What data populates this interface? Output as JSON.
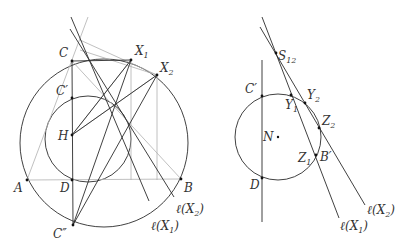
{
  "left_figure": {
    "labels": {
      "C": "C",
      "C_prime": "C′",
      "C_double_prime": "C″",
      "H": "H",
      "D": "D",
      "A": "A",
      "B": "B",
      "X1": "X",
      "X1_sub": "1",
      "X2": "X",
      "X2_sub": "2",
      "lX1": "ℓ(X",
      "lX1_sub": "1",
      "lX1_close": ")",
      "lX2": "ℓ(X",
      "lX2_sub": "2",
      "lX2_close": ")"
    },
    "points": {
      "C": [
        72,
        61
      ],
      "X1": [
        131,
        60
      ],
      "X2": [
        157,
        75
      ],
      "C_prime": [
        72,
        98
      ],
      "H": [
        72,
        135
      ],
      "D": [
        72,
        180
      ],
      "A": [
        27,
        180
      ],
      "B": [
        181,
        179
      ],
      "C_double_prime": [
        73,
        225
      ]
    },
    "circles": {
      "circumcircle": {
        "cx": 104,
        "cy": 143,
        "r": 84
      },
      "nine_point": {
        "cx": 88,
        "cy": 139,
        "r": 43
      }
    }
  },
  "right_figure": {
    "labels": {
      "S12": "S",
      "S12_sub": "12",
      "C_prime": "C′",
      "Y1": "Y",
      "Y1_sub": "1",
      "Y2": "Y",
      "Y2_sub": "2",
      "Z2": "Z",
      "Z2_sub": "2",
      "N": "N",
      "Z1": "Z",
      "Z1_sub": "1",
      "B_prime": "B′",
      "D": "D",
      "lX1": "ℓ(X",
      "lX1_sub": "1",
      "lX1_close": ")",
      "lX2": "ℓ(X",
      "lX2_sub": "2",
      "lX2_close": ")"
    },
    "points": {
      "S12": [
        276,
        53
      ],
      "C_prime": [
        262,
        96
      ],
      "Y1": [
        291,
        95
      ],
      "Y2": [
        305,
        103
      ],
      "Z2": [
        319,
        128
      ],
      "N": [
        278,
        137
      ],
      "Z1": [
        316,
        155
      ],
      "D": [
        262,
        178
      ]
    },
    "circles": {
      "nine_point": {
        "cx": 278,
        "cy": 137,
        "r": 43
      }
    }
  }
}
